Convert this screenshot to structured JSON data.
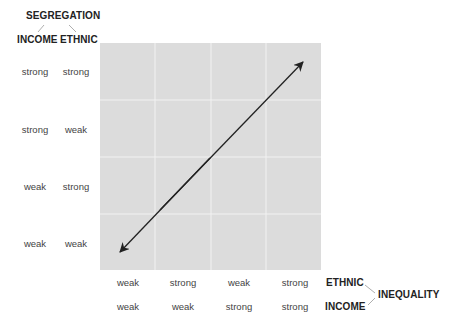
{
  "segregation": {
    "title": "SEGREGATION",
    "income_label": "INCOME",
    "ethnic_label": "ETHNIC"
  },
  "inequality": {
    "title": "INEQUALITY",
    "ethnic_label": "ETHNIC",
    "income_label": "INCOME"
  },
  "rows": [
    {
      "income": "strong",
      "ethnic": "strong"
    },
    {
      "income": "strong",
      "ethnic": "weak"
    },
    {
      "income": "weak",
      "ethnic": "strong"
    },
    {
      "income": "weak",
      "ethnic": "weak"
    }
  ],
  "columns": [
    {
      "ethnic": "weak",
      "income": "weak"
    },
    {
      "ethnic": "strong",
      "income": "weak"
    },
    {
      "ethnic": "weak",
      "income": "strong"
    },
    {
      "ethnic": "strong",
      "income": "strong"
    }
  ],
  "colors": {
    "grid_background": "#dcdcdc",
    "grid_lines": "#f2f2f2",
    "arrow": "#222222"
  },
  "diagram": {
    "type": "4x4 grid with double-headed diagonal arrow",
    "arrow_from": "weak/weak segregation & weak/weak inequality (bottom-left)",
    "arrow_to": "strong/strong segregation & strong/strong inequality (top-right)"
  }
}
